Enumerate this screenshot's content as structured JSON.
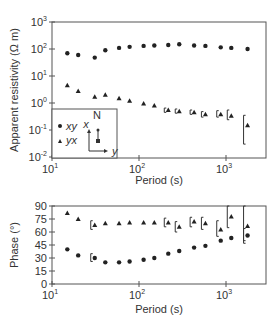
{
  "chart_data": [
    {
      "type": "scatter",
      "title": "",
      "xlabel": "Period (s)",
      "ylabel": "Apparent resistivity (Ω m)",
      "xscale": "log",
      "yscale": "log",
      "xlim": [
        10,
        2500
      ],
      "ylim": [
        0.01,
        1000
      ],
      "xticks": [
        "10^1",
        "10^2",
        "10^3"
      ],
      "yticks": [
        "10^-2",
        "10^-1",
        "10^0",
        "10^1",
        "10^2",
        "10^3"
      ],
      "grid": false,
      "legend": {
        "position": "inset-lower-left",
        "entries": [
          {
            "marker": "circle",
            "label": "xy"
          },
          {
            "marker": "triangle",
            "label": "yx"
          }
        ],
        "compass": {
          "north_label": "N",
          "x_label": "x",
          "y_label": "y"
        }
      },
      "series": [
        {
          "name": "xy",
          "marker": "circle",
          "x": [
            15,
            20,
            31,
            41,
            59,
            78,
            113,
            150,
            217,
            290,
            430,
            580,
            870,
            1150,
            1770
          ],
          "y": [
            70,
            60,
            48,
            90,
            110,
            120,
            130,
            135,
            140,
            150,
            135,
            130,
            115,
            110,
            100
          ]
        },
        {
          "name": "yx",
          "marker": "triangle",
          "x": [
            15,
            20,
            31,
            41,
            59,
            78,
            113,
            150,
            217,
            290,
            430,
            580,
            870,
            1150,
            1770
          ],
          "y": [
            4.5,
            2.8,
            1.7,
            2.0,
            1.5,
            1.2,
            0.95,
            0.8,
            0.55,
            0.5,
            0.45,
            0.38,
            0.38,
            0.34,
            0.15
          ],
          "error_bars": [
            {
              "x": 217,
              "low": 0.45,
              "high": 0.65
            },
            {
              "x": 290,
              "low": 0.42,
              "high": 0.6
            },
            {
              "x": 430,
              "low": 0.38,
              "high": 0.55
            },
            {
              "x": 580,
              "low": 0.3,
              "high": 0.48
            },
            {
              "x": 870,
              "low": 0.3,
              "high": 0.52
            },
            {
              "x": 1150,
              "low": 0.24,
              "high": 0.55
            },
            {
              "x": 1770,
              "low": 0.03,
              "high": 0.35
            }
          ]
        }
      ]
    },
    {
      "type": "scatter",
      "title": "",
      "xlabel": "Period (s)",
      "ylabel": "Phase (°)",
      "xscale": "log",
      "yscale": "linear",
      "xlim": [
        10,
        2500
      ],
      "ylim": [
        0,
        90
      ],
      "xticks": [
        "10^1",
        "10^2",
        "10^3"
      ],
      "yticks": [
        0,
        15,
        30,
        45,
        60,
        75,
        90
      ],
      "grid": false,
      "series": [
        {
          "name": "xy",
          "marker": "circle",
          "x": [
            15,
            20,
            31,
            41,
            59,
            78,
            113,
            150,
            217,
            290,
            430,
            580,
            870,
            1150,
            1770
          ],
          "y": [
            40,
            33,
            30,
            25,
            25,
            26,
            28,
            30,
            35,
            38,
            42,
            44,
            50,
            53,
            56
          ],
          "error_bars": [
            {
              "x": 31,
              "low": 26,
              "high": 35
            },
            {
              "x": 1770,
              "low": 47,
              "high": 64
            }
          ]
        },
        {
          "name": "yx",
          "marker": "triangle",
          "x": [
            15,
            20,
            31,
            41,
            59,
            78,
            113,
            150,
            217,
            290,
            430,
            580,
            870,
            1150,
            1770
          ],
          "y": [
            82,
            75,
            68,
            70,
            70,
            71,
            71,
            71,
            71,
            66,
            72,
            70,
            63,
            78,
            67
          ],
          "error_bars": [
            {
              "x": 31,
              "low": 63,
              "high": 73
            },
            {
              "x": 217,
              "low": 66,
              "high": 76
            },
            {
              "x": 290,
              "low": 60,
              "high": 72
            },
            {
              "x": 430,
              "low": 66,
              "high": 77
            },
            {
              "x": 580,
              "low": 63,
              "high": 77
            },
            {
              "x": 870,
              "low": 55,
              "high": 73
            },
            {
              "x": 1150,
              "low": 65,
              "high": 90
            },
            {
              "x": 1770,
              "low": 50,
              "high": 90
            }
          ]
        }
      ]
    }
  ],
  "labels": {
    "top_ylabel": "Apparent resistivity (Ω m)",
    "bottom_ylabel": "Phase (°)",
    "xlabel": "Period (s)",
    "legend_xy": "xy",
    "legend_yx": "yx",
    "compass_n": "N",
    "compass_x": "x",
    "compass_y": "y"
  }
}
